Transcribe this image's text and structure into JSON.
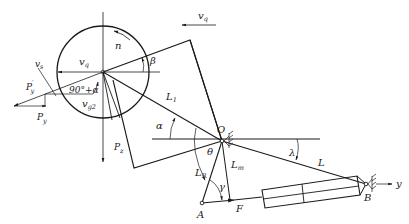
{
  "diagram": {
    "type": "mechanism-force-diagram",
    "labels": {
      "n": "n",
      "vq_top": "v",
      "vq_top_sub": "q",
      "vq_circle": "v",
      "vq_circle_sub": "q",
      "vs": "v",
      "vs_sub": "s",
      "vg2": "v",
      "vg2_sub": "g2",
      "angle_90_alpha": "90°+α",
      "Py_prime": "P",
      "Py_prime_sub": "y",
      "Py_prime_mark": "′",
      "Py": "P",
      "Py_sub": "y",
      "Pz": "P",
      "Pz_sub": "z",
      "beta": "β",
      "L1": "L",
      "L1_sub": "1",
      "alpha": "α",
      "O": "O",
      "theta": "θ",
      "LR": "L",
      "LR_sub": "R",
      "Lm": "L",
      "Lm_sub": "m",
      "gamma": "γ",
      "lambda": "λ",
      "L": "L",
      "A": "A",
      "F": "F",
      "B": "B",
      "y": "y"
    },
    "points": {
      "circle_center": [
        103,
        72
      ],
      "O": [
        222,
        141
      ],
      "A": [
        202,
        203
      ],
      "B": [
        366,
        184
      ]
    }
  }
}
